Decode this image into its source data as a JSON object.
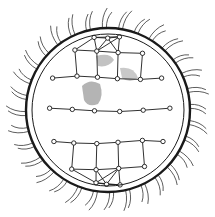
{
  "illustration": {
    "subject": "network-globe",
    "description": "Line-art sphere with outer ring, radiating spines, and a mesh of connected nodes with faint continent shading",
    "colors": {
      "background": "#ffffff",
      "stroke": "#1a1a1a",
      "shade": "#777777"
    },
    "center": [
      108,
      110
    ],
    "outer_radius": 82,
    "inner_radius": 76,
    "spine_length": 16,
    "spine_count": 64
  }
}
